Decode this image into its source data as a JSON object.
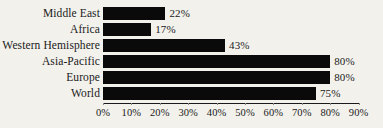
{
  "chart_data": {
    "type": "bar",
    "orientation": "horizontal",
    "title": "",
    "xlabel": "",
    "ylabel": "",
    "categories": [
      "Middle East",
      "Africa",
      "Western Hemisphere",
      "Asia-Pacific",
      "Europe",
      "World"
    ],
    "values": [
      22,
      17,
      43,
      80,
      80,
      75
    ],
    "value_labels": [
      "22%",
      "17%",
      "43%",
      "80%",
      "80%",
      "75%"
    ],
    "xlim": [
      0,
      90
    ],
    "xticks": [
      0,
      10,
      20,
      30,
      40,
      50,
      60,
      70,
      80,
      90
    ],
    "xtick_labels": [
      "0%",
      "10%",
      "20%",
      "30%",
      "40%",
      "50%",
      "60%",
      "70%",
      "80%",
      "90%"
    ],
    "grid": false,
    "legend": null,
    "bar_color": "#0a0a0a",
    "background_color": "#f2f1ec",
    "text_color": "#1a1a1a"
  }
}
